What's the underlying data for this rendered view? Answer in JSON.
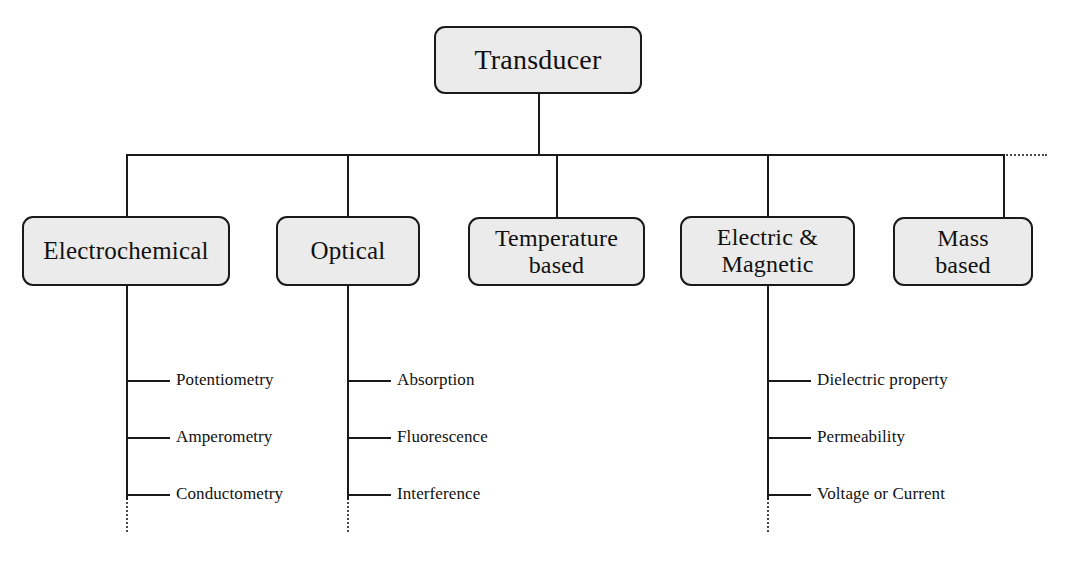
{
  "diagram": {
    "root": {
      "label": "Transducer"
    },
    "bus": {
      "continuation_style": "dotted",
      "continuation_note": "horizontal bus continues as dotted line to the right edge"
    },
    "categories": [
      {
        "id": "electrochemical",
        "label": "Electrochemical",
        "has_children": true,
        "children_continue": true,
        "children": [
          {
            "label": "Potentiometry"
          },
          {
            "label": "Amperometry"
          },
          {
            "label": "Conductometry"
          }
        ]
      },
      {
        "id": "optical",
        "label": "Optical",
        "has_children": true,
        "children_continue": true,
        "children": [
          {
            "label": "Absorption"
          },
          {
            "label": "Fluorescence"
          },
          {
            "label": "Interference"
          }
        ]
      },
      {
        "id": "temperature-based",
        "label": "Temperature\nbased",
        "has_children": false,
        "children_continue": false,
        "children": []
      },
      {
        "id": "electric-and-magnetic",
        "label": "Electric &\nMagnetic",
        "has_children": true,
        "children_continue": true,
        "children": [
          {
            "label": "Dielectric property"
          },
          {
            "label": "Permeability"
          },
          {
            "label": "Voltage or Current"
          }
        ]
      },
      {
        "id": "mass-based",
        "label": "Mass\nbased",
        "has_children": false,
        "children_continue": false,
        "children": []
      }
    ],
    "colors": {
      "node_fill": "#ebebeb",
      "node_border": "#1a1a1a",
      "line": "#1a1a1a",
      "dotted_line": "#4a4a4a",
      "text": "#111111",
      "background": "#ffffff"
    }
  }
}
